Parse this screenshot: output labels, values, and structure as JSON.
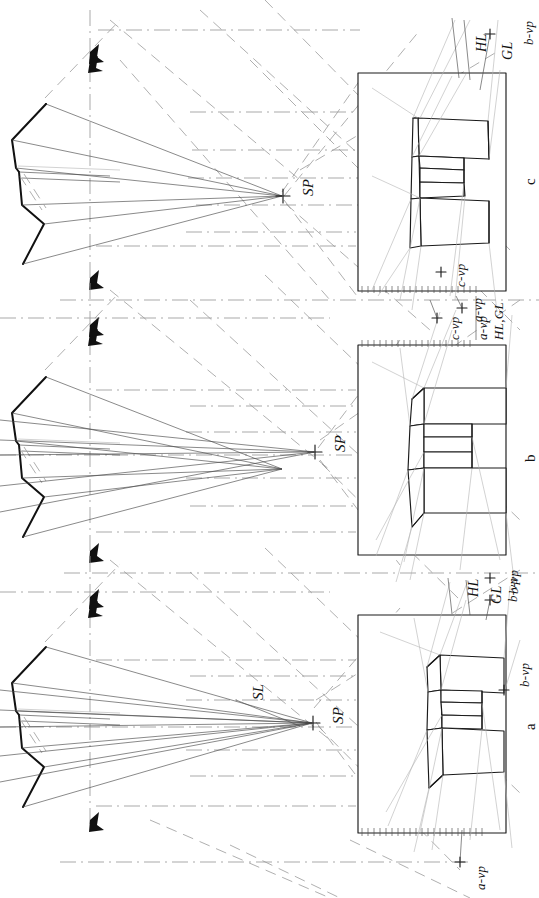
{
  "drawing": {
    "title": "Three-point / two-point perspective construction of a C-shaped block",
    "orientation": "sheet rotated 90 degrees counter-clockwise",
    "ink_color": "#1a1a1a",
    "construction_color": "#8a8a8a",
    "paper_color": "#ffffff"
  },
  "panels": [
    {
      "id": "a",
      "label": "a",
      "frame": {
        "x": 358,
        "y": 615,
        "w": 148,
        "h": 218
      },
      "labels": [
        {
          "key": "HL",
          "text": "HL"
        },
        {
          "key": "GL",
          "text": "GL"
        },
        {
          "key": "b-vp",
          "text": "b-vp"
        },
        {
          "key": "b-vp-on-frame",
          "text": "b-vp"
        },
        {
          "key": "a-vp",
          "text": "a-vp"
        }
      ],
      "station_point_label": "SP",
      "sight_line_label": "SL"
    },
    {
      "id": "b",
      "label": "b",
      "frame": {
        "x": 358,
        "y": 345,
        "w": 148,
        "h": 210
      },
      "labels": [
        {
          "key": "c-vp",
          "text": "c-vp"
        },
        {
          "key": "a-vp",
          "text": "a-vp"
        },
        {
          "key": "HL,GL",
          "text": "HL,GL"
        },
        {
          "key": "b-vp",
          "text": "b-vp"
        }
      ],
      "station_point_label": "SP"
    },
    {
      "id": "c",
      "label": "c",
      "frame": {
        "x": 358,
        "y": 73,
        "w": 148,
        "h": 218
      },
      "labels": [
        {
          "key": "HL",
          "text": "HL"
        },
        {
          "key": "GL",
          "text": "GL"
        },
        {
          "key": "b-vp",
          "text": "b-vp"
        },
        {
          "key": "c-vp",
          "text": "c-vp"
        },
        {
          "key": "a-vp",
          "text": "a-vp"
        }
      ]
    }
  ],
  "annotations": {
    "sp_a": "SP",
    "sp_b": "SP",
    "sp_c": "SP",
    "sl": "SL",
    "hl_a": "HL",
    "gl_a": "GL",
    "bvp_a_top": "b-vp",
    "bvp_a_frame": "b-vp",
    "avp_a_bottom": "a-vp",
    "panel_a": "a",
    "cvp_b_top": "c-vp",
    "avp_b_top": "a-vp",
    "hlgl_b": "HL,GL",
    "bvp_b_bottom": "b-vp",
    "panel_b": "b",
    "hl_c": "HL",
    "gl_c": "GL",
    "bvp_c_top": "b-vp",
    "cvp_c_bottom": "c-vp",
    "avp_c_bottom": "a-vp",
    "panel_c": "c"
  },
  "plan_views": [
    {
      "id": "plan-a",
      "note": "C-shaped plan, heavy outline, with picture-plane and sight lines converging to SP"
    },
    {
      "id": "plan-b",
      "note": "C-shaped plan, heavy outline, with picture-plane and sight lines converging to SP"
    },
    {
      "id": "plan-c",
      "note": "C-shaped plan, heavy outline, with picture-plane and sight lines converging to SP"
    }
  ]
}
